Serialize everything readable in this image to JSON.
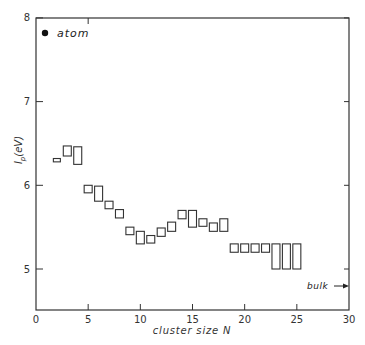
{
  "chart_data": {
    "type": "scatter",
    "title": "",
    "xlabel": "cluster size N",
    "ylabel": "I_p (eV)",
    "xlim": [
      0,
      30
    ],
    "ylim": [
      4.5,
      8
    ],
    "xticks": [
      0,
      5,
      10,
      15,
      20,
      25,
      30
    ],
    "yticks": [
      5,
      6,
      7,
      8
    ],
    "grid": false,
    "legend": {
      "position": "top-left",
      "entries": [
        {
          "marker": "filled-circle",
          "label": "atom"
        }
      ]
    },
    "annotations": [
      {
        "text": "bulk",
        "arrow": "right",
        "y": 4.85,
        "x": 30
      }
    ],
    "series": [
      {
        "name": "cluster ionization potential (range boxes)",
        "points": [
          {
            "N": 2,
            "low": 6.28,
            "high": 6.32
          },
          {
            "N": 3,
            "low": 6.35,
            "high": 6.47
          },
          {
            "N": 4,
            "low": 6.25,
            "high": 6.46
          },
          {
            "N": 5,
            "low": 5.91,
            "high": 6.0
          },
          {
            "N": 6,
            "low": 5.81,
            "high": 5.99
          },
          {
            "N": 7,
            "low": 5.72,
            "high": 5.81
          },
          {
            "N": 8,
            "low": 5.61,
            "high": 5.71
          },
          {
            "N": 9,
            "low": 5.41,
            "high": 5.5
          },
          {
            "N": 10,
            "low": 5.3,
            "high": 5.45
          },
          {
            "N": 11,
            "low": 5.31,
            "high": 5.4
          },
          {
            "N": 12,
            "low": 5.39,
            "high": 5.49
          },
          {
            "N": 13,
            "low": 5.45,
            "high": 5.56
          },
          {
            "N": 14,
            "low": 5.6,
            "high": 5.7
          },
          {
            "N": 15,
            "low": 5.5,
            "high": 5.7
          },
          {
            "N": 16,
            "low": 5.51,
            "high": 5.6
          },
          {
            "N": 17,
            "low": 5.45,
            "high": 5.55
          },
          {
            "N": 18,
            "low": 5.45,
            "high": 5.6
          },
          {
            "N": 19,
            "low": 5.2,
            "high": 5.3
          },
          {
            "N": 20,
            "low": 5.2,
            "high": 5.3
          },
          {
            "N": 21,
            "low": 5.2,
            "high": 5.3
          },
          {
            "N": 22,
            "low": 5.2,
            "high": 5.3
          },
          {
            "N": 23,
            "low": 5.0,
            "high": 5.3
          },
          {
            "N": 24,
            "low": 5.0,
            "high": 5.3
          },
          {
            "N": 25,
            "low": 5.0,
            "high": 5.3
          }
        ]
      },
      {
        "name": "atom",
        "points": [
          {
            "N": 1,
            "value": 7.9
          }
        ]
      }
    ]
  },
  "labels": {
    "legend_atom": "atom",
    "bulk": "bulk",
    "xlabel": "cluster size N",
    "ylabel_main": "I",
    "ylabel_sub": "p",
    "ylabel_unit": "(eV)"
  }
}
